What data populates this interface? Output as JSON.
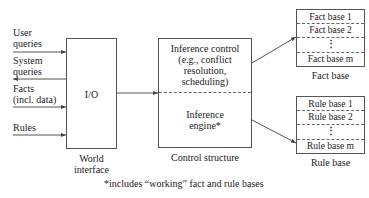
{
  "inputs": [
    {
      "label_line1": "User",
      "label_line2": "queries",
      "direction": "in"
    },
    {
      "label_line1": "System",
      "label_line2": "queries",
      "direction": "out"
    },
    {
      "label_line1": "Facts",
      "label_line2": "(incl. data)",
      "direction": "in"
    },
    {
      "label_line1": "Rules",
      "label_line2": "",
      "direction": "in"
    }
  ],
  "world_interface": {
    "box_label": "I/O",
    "caption_line1": "World",
    "caption_line2": "interface"
  },
  "control_structure": {
    "top_line1": "Inference control",
    "top_line2": "(e.g., conflict",
    "top_line3": "resolution,",
    "top_line4": "scheduling)",
    "bottom_line1": "Inference",
    "bottom_line2": "engine*",
    "caption": "Control structure"
  },
  "fact_base": {
    "items": [
      "Fact base 1",
      "Fact base 2",
      "⋮",
      "Fact base m"
    ],
    "caption": "Fact base"
  },
  "rule_base": {
    "items": [
      "Rule base 1",
      "Rule base 2",
      "⋮",
      "Rule base m"
    ],
    "caption": "Rule base"
  },
  "footnote": "*includes “working” fact and rule bases",
  "colors": {
    "line": "#555555",
    "text": "#222222",
    "background": "#ffffff"
  }
}
